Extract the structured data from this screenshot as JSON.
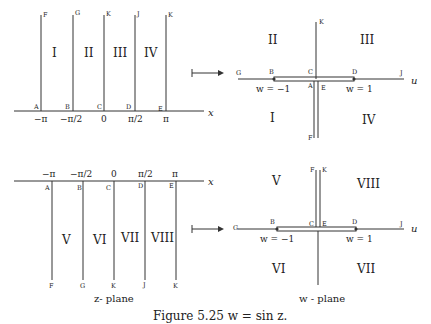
{
  "caption": "Figure 5.25 w = sin z.",
  "z_plane_label": "z- plane",
  "w_plane_label": "w - plane",
  "upper_z": {
    "axis_label": "x",
    "ticks": [
      "−π",
      "−π/2",
      "0",
      "π/2",
      "π"
    ],
    "points_bottom": [
      "A",
      "B",
      "C",
      "D",
      "E"
    ],
    "points_top": [
      "F",
      "G",
      "K",
      "J",
      "K"
    ],
    "regions": [
      "I",
      "II",
      "III",
      "IV"
    ]
  },
  "lower_z": {
    "axis_label": "x",
    "ticks": [
      "−π",
      "−π/2",
      "0",
      "π/2",
      "π"
    ],
    "points_top": [
      "A",
      "B",
      "C",
      "D",
      "E"
    ],
    "points_bottom": [
      "F",
      "G",
      "K",
      "J",
      "K"
    ],
    "regions": [
      "V",
      "VI",
      "VII",
      "VIII"
    ]
  },
  "upper_w": {
    "axis_label": "u",
    "points": {
      "G": "G",
      "B": "B",
      "C": "C",
      "D": "D",
      "J": "J",
      "A": "A",
      "E": "E",
      "K": "K",
      "F": "F"
    },
    "minus_one": "w = −1",
    "plus_one": "w = 1",
    "regions": {
      "tl": "II",
      "tr": "III",
      "bl": "I",
      "br": "IV"
    }
  },
  "lower_w": {
    "axis_label": "u",
    "points": {
      "G": "G",
      "B": "B",
      "C": "C",
      "E": "E",
      "D": "D",
      "J": "J",
      "F": "F",
      "K": "K"
    },
    "minus_one": "w = −1",
    "plus_one": "w = 1",
    "regions": {
      "tl": "V",
      "tr": "VIII",
      "bl": "VI",
      "br": "VII"
    }
  }
}
